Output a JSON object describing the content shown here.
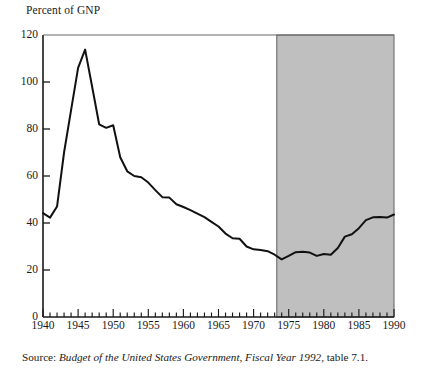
{
  "figure": {
    "axis_title": "Percent of GNP",
    "source": {
      "label": "Source: ",
      "title": "Budget of the United States Government, Fiscal Year 1992",
      "tail": ", table 7.1."
    }
  },
  "colors": {
    "line": "#111111",
    "axis": "#1a1a1a",
    "shaded_region_fill": "#bfbfbf",
    "shaded_region_stroke": "#6b6b6b",
    "background": "#ffffff"
  },
  "chart_data": {
    "type": "line",
    "title": "",
    "xlabel": "",
    "ylabel": "Percent of GNP",
    "xlim": [
      1940,
      1990
    ],
    "ylim": [
      0,
      120
    ],
    "yticks": [
      0,
      20,
      40,
      60,
      80,
      100,
      120
    ],
    "xticks": [
      1940,
      1945,
      1950,
      1955,
      1960,
      1965,
      1970,
      1975,
      1980,
      1985,
      1990
    ],
    "xtick_minor_step": 1,
    "grid": false,
    "legend": null,
    "shaded_region": {
      "x_start": 1973.3,
      "x_end": 1990,
      "y_start": 0,
      "y_end": 120,
      "note": "shaded band covering 1973-1990"
    },
    "series": [
      {
        "name": "Federal debt held by the public as percent of GNP",
        "x": [
          1940,
          1941,
          1942,
          1943,
          1944,
          1945,
          1946,
          1947,
          1948,
          1949,
          1950,
          1951,
          1952,
          1953,
          1954,
          1955,
          1956,
          1957,
          1958,
          1959,
          1960,
          1961,
          1962,
          1963,
          1964,
          1965,
          1966,
          1967,
          1968,
          1969,
          1970,
          1971,
          1972,
          1973,
          1974,
          1975,
          1976,
          1977,
          1978,
          1979,
          1980,
          1981,
          1982,
          1983,
          1984,
          1985,
          1986,
          1987,
          1988,
          1989,
          1990
        ],
        "values": [
          44.2,
          42.3,
          47.0,
          70.0,
          88.0,
          106.0,
          113.8,
          98.0,
          82.0,
          80.5,
          81.6,
          68.0,
          62.0,
          60.0,
          59.5,
          57.2,
          54.0,
          51.0,
          50.8,
          48.0,
          46.8,
          45.5,
          44.0,
          42.5,
          40.5,
          38.5,
          35.5,
          33.5,
          33.3,
          30.0,
          28.8,
          28.5,
          28.0,
          26.5,
          24.5,
          26.0,
          27.6,
          27.8,
          27.4,
          26.0,
          26.8,
          26.5,
          29.4,
          34.2,
          35.2,
          37.8,
          41.2,
          42.4,
          42.6,
          42.3,
          43.6
        ]
      }
    ]
  }
}
